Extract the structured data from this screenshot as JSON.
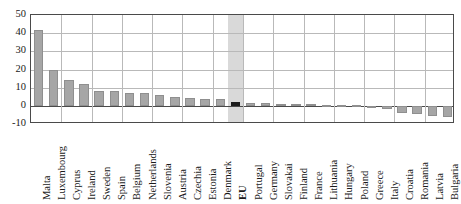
{
  "chart_data": {
    "type": "bar",
    "title": "",
    "subtitle": "",
    "xlabel": "",
    "ylabel": "",
    "ylim": [
      -10,
      50
    ],
    "yticks": [
      -10,
      0,
      10,
      20,
      30,
      40,
      50
    ],
    "ytick_labels": [
      "-10",
      "0",
      "10",
      "20",
      "30",
      "40",
      "50"
    ],
    "grid": true,
    "legend": "none",
    "highlight_category": "EU",
    "highlight_band_color": "#d9d9d9",
    "bar_color": "#a6a6a6",
    "highlight_bar_color": "#1c1c1c",
    "categories": [
      "Malta",
      "Luxembourg",
      "Cyprus",
      "Ireland",
      "Sweden",
      "Spain",
      "Belgium",
      "Netherlands",
      "Slovenia",
      "Austria",
      "Czechia",
      "Estonia",
      "Denmark",
      "EU",
      "Portugal",
      "Germany",
      "Slovakai",
      "Finland",
      "France",
      "Lithuania",
      "Hungary",
      "Poland",
      "Greece",
      "Italy",
      "Croatia",
      "Romania",
      "Latvia",
      "Bulgaria"
    ],
    "values": [
      42,
      20,
      14,
      12,
      8,
      8,
      7,
      7,
      6,
      5,
      4.5,
      4,
      3.5,
      2,
      1.5,
      1.5,
      1,
      1,
      0.8,
      0.5,
      0.4,
      0.2,
      -1,
      -1.5,
      -4,
      -4.5,
      -5.5,
      -6
    ]
  },
  "caption_remnant": ""
}
